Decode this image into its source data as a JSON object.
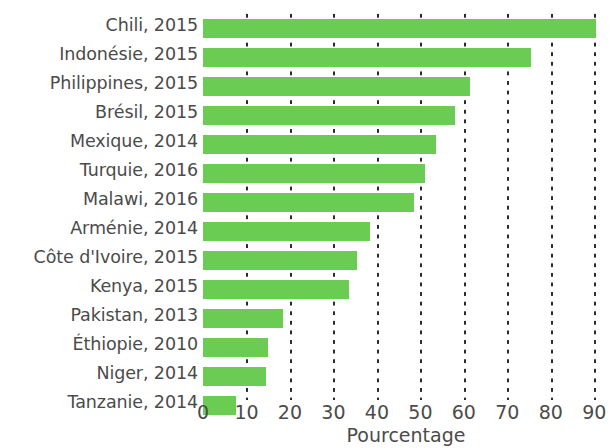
{
  "chart_data": {
    "type": "bar",
    "orientation": "horizontal",
    "title": "",
    "subtitle": "",
    "xlabel": "Pourcentage",
    "ylabel": "",
    "xlim": [
      0,
      92
    ],
    "xticks": [
      0,
      10,
      20,
      30,
      40,
      50,
      60,
      70,
      80,
      90
    ],
    "xtick_labels": [
      "0",
      "10",
      "20",
      "30",
      "40",
      "50",
      "60",
      "70",
      "80",
      "90"
    ],
    "grid": "vertical-dotted",
    "legend": "none",
    "bar_color": "#6bcc53",
    "text_color": "#4b4b4b",
    "background": "#ffffff",
    "categories": [
      "Chili, 2015",
      "Indonésie, 2015",
      "Philippines, 2015",
      "Brésil, 2015",
      "Mexique, 2014",
      "Turquie, 2016",
      "Malawi, 2016",
      "Arménie, 2014",
      "Côte d'Ivoire, 2015",
      "Kenya, 2015",
      "Pakistan, 2013",
      "Éthiopie, 2010",
      "Niger, 2014",
      "Tanzanie, 2014"
    ],
    "values": [
      90.5,
      75.5,
      61.5,
      58.0,
      53.5,
      51.0,
      48.5,
      38.5,
      35.5,
      33.5,
      18.5,
      15.0,
      14.5,
      7.5
    ]
  }
}
